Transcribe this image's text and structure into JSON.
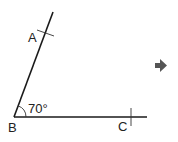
{
  "diagram": {
    "points": {
      "A": {
        "label": "A"
      },
      "B": {
        "label": "B"
      },
      "C": {
        "label": "C"
      }
    },
    "angle": {
      "vertex": "B",
      "label": "70°"
    },
    "arrow": {
      "icon": "right-arrow-icon",
      "direction": "right"
    },
    "colors": {
      "line": "#1a1a1a",
      "text": "#222222",
      "arrow": "#555555"
    }
  }
}
